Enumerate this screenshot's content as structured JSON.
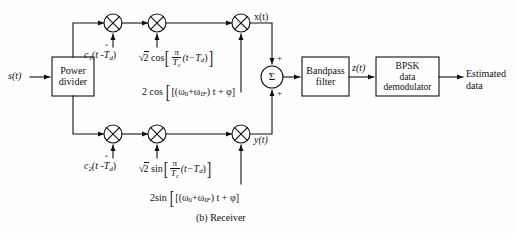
{
  "figure": {
    "caption": "(b)  Receiver",
    "title_part": "(b)",
    "title_name": "Receiver"
  },
  "blocks": {
    "power_divider": {
      "line1": "Power",
      "line2": "divider"
    },
    "bandpass_filter": {
      "line1": "Bandpass",
      "line2": "filter"
    },
    "bpsk_demod": {
      "line1": "BPSK",
      "line2": "data",
      "line3": "demodulator"
    },
    "summer": {
      "symbol": "Σ"
    },
    "mixer_symbol": "⊗"
  },
  "signals": {
    "input": "s(t)",
    "upper_out": "x(t)",
    "lower_out": "y(t)",
    "sum_out": "z(t)",
    "output_line1": "Estimated",
    "output_line2": "data"
  },
  "sum_signs": {
    "top": "+",
    "bottom": "+"
  },
  "upper_branch": {
    "despread": {
      "code": "c",
      "index": "1",
      "arg_open": "(t -",
      "hat_var": "T",
      "hat": "ˆ",
      "sub": "d",
      "arg_close": ")"
    },
    "carrier": {
      "coef": "2",
      "radical": "√",
      "func": "cos",
      "num": "π",
      "den_var": "T",
      "den_sub": "c",
      "inner": "(t−T",
      "inner_sub": "d",
      "inner_close": ")"
    },
    "lo": {
      "coef": "2 cos",
      "open": "[(ω",
      "sub0": "0",
      "plus": "+ω",
      "subIF": "IF",
      "mid": ") t + φ]"
    }
  },
  "lower_branch": {
    "despread": {
      "code": "c",
      "index": "2",
      "arg_open": "(t -",
      "hat_var": "T",
      "hat": "ˆ",
      "sub": "d",
      "arg_close": ")"
    },
    "carrier": {
      "coef": "2",
      "radical": "√",
      "func": "sin",
      "num": "π",
      "den_var": "T",
      "den_sub": "c",
      "inner": "(t−T",
      "inner_sub": "d",
      "inner_close": ")"
    },
    "lo": {
      "coef": "2sin",
      "open": "[(ω",
      "sub0": "0",
      "plus": "+ω",
      "subIF": "IF",
      "mid": ") t + φ]"
    }
  },
  "colors": {
    "stroke": "#111111",
    "background": "#fefefe",
    "text": "#111111"
  }
}
